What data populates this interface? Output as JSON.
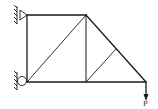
{
  "diagram": {
    "type": "truss",
    "load_label": "P",
    "stroke_color": "#1a1a1a",
    "nodes": {
      "top_left": [
        27,
        15
      ],
      "top_mid": [
        86,
        15
      ],
      "bottom_left": [
        27,
        82
      ],
      "bottom_mid": [
        86,
        82
      ],
      "right_tip": [
        146,
        82
      ],
      "slope_mid": [
        116,
        49
      ]
    },
    "supports": [
      {
        "type": "pin",
        "node": "top_left"
      },
      {
        "type": "roller",
        "node": "bottom_left"
      }
    ],
    "load": {
      "node": "right_tip",
      "direction": "down"
    }
  }
}
